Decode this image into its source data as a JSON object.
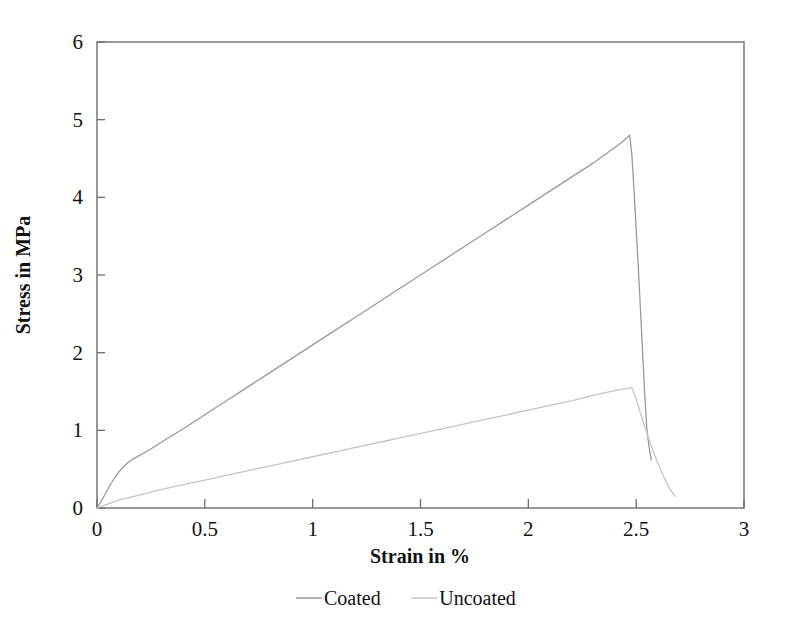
{
  "chart_data": {
    "type": "line",
    "title": "",
    "xlabel": "Strain in %",
    "ylabel": "Stress in MPa",
    "xlim": [
      0,
      3
    ],
    "ylim": [
      0,
      6
    ],
    "xticks": [
      "0",
      "0.5",
      "1",
      "1.5",
      "2",
      "2.5",
      "3"
    ],
    "xtick_values": [
      0,
      0.5,
      1,
      1.5,
      2,
      2.5,
      3
    ],
    "yticks": [
      "0",
      "1",
      "2",
      "3",
      "4",
      "5",
      "6"
    ],
    "ytick_values": [
      0,
      1,
      2,
      3,
      4,
      5,
      6
    ],
    "grid": false,
    "legend_position": "bottom",
    "series": [
      {
        "name": "Coated",
        "color": "#9a9a9a",
        "peak_strain": 2.47,
        "peak_stress": 4.8,
        "points": [
          [
            0.0,
            0.0
          ],
          [
            0.02,
            0.09
          ],
          [
            0.04,
            0.19
          ],
          [
            0.06,
            0.29
          ],
          [
            0.08,
            0.38
          ],
          [
            0.1,
            0.46
          ],
          [
            0.13,
            0.55
          ],
          [
            0.16,
            0.62
          ],
          [
            0.2,
            0.68
          ],
          [
            0.25,
            0.76
          ],
          [
            0.3,
            0.85
          ],
          [
            0.4,
            1.02
          ],
          [
            0.5,
            1.2
          ],
          [
            0.6,
            1.38
          ],
          [
            0.7,
            1.56
          ],
          [
            0.8,
            1.74
          ],
          [
            0.9,
            1.92
          ],
          [
            1.0,
            2.1
          ],
          [
            1.1,
            2.28
          ],
          [
            1.2,
            2.46
          ],
          [
            1.3,
            2.64
          ],
          [
            1.4,
            2.82
          ],
          [
            1.5,
            3.0
          ],
          [
            1.6,
            3.18
          ],
          [
            1.7,
            3.36
          ],
          [
            1.8,
            3.54
          ],
          [
            1.9,
            3.72
          ],
          [
            2.0,
            3.9
          ],
          [
            2.1,
            4.08
          ],
          [
            2.2,
            4.26
          ],
          [
            2.3,
            4.44
          ],
          [
            2.38,
            4.6
          ],
          [
            2.43,
            4.7
          ],
          [
            2.47,
            4.8
          ],
          [
            2.48,
            4.55
          ],
          [
            2.49,
            4.1
          ],
          [
            2.5,
            3.6
          ],
          [
            2.51,
            3.1
          ],
          [
            2.52,
            2.55
          ],
          [
            2.53,
            2.0
          ],
          [
            2.54,
            1.45
          ],
          [
            2.55,
            1.0
          ],
          [
            2.56,
            0.78
          ],
          [
            2.57,
            0.62
          ]
        ]
      },
      {
        "name": "Uncoated",
        "color": "#c4c4c4",
        "peak_strain": 2.48,
        "peak_stress": 1.55,
        "points": [
          [
            0.0,
            0.0
          ],
          [
            0.05,
            0.05
          ],
          [
            0.1,
            0.1
          ],
          [
            0.2,
            0.17
          ],
          [
            0.3,
            0.24
          ],
          [
            0.4,
            0.3
          ],
          [
            0.5,
            0.36
          ],
          [
            0.6,
            0.42
          ],
          [
            0.7,
            0.48
          ],
          [
            0.8,
            0.54
          ],
          [
            0.9,
            0.6
          ],
          [
            1.0,
            0.66
          ],
          [
            1.1,
            0.72
          ],
          [
            1.2,
            0.78
          ],
          [
            1.3,
            0.84
          ],
          [
            1.4,
            0.9
          ],
          [
            1.5,
            0.96
          ],
          [
            1.6,
            1.02
          ],
          [
            1.7,
            1.08
          ],
          [
            1.8,
            1.14
          ],
          [
            1.9,
            1.2
          ],
          [
            2.0,
            1.26
          ],
          [
            2.1,
            1.32
          ],
          [
            2.2,
            1.38
          ],
          [
            2.3,
            1.45
          ],
          [
            2.4,
            1.51
          ],
          [
            2.48,
            1.55
          ],
          [
            2.5,
            1.4
          ],
          [
            2.52,
            1.22
          ],
          [
            2.54,
            1.05
          ],
          [
            2.56,
            0.88
          ],
          [
            2.58,
            0.72
          ],
          [
            2.6,
            0.58
          ],
          [
            2.62,
            0.45
          ],
          [
            2.64,
            0.33
          ],
          [
            2.66,
            0.23
          ],
          [
            2.68,
            0.15
          ]
        ]
      }
    ],
    "legend": [
      {
        "label": "Coated",
        "color": "#9a9a9a"
      },
      {
        "label": "Uncoated",
        "color": "#c4c4c4"
      }
    ]
  },
  "axes": {
    "frame_color": "#6e6e6e"
  }
}
